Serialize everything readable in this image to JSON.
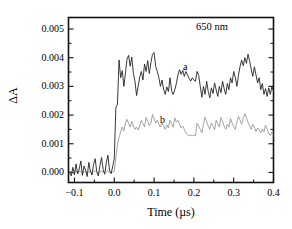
{
  "chart_data": {
    "type": "line",
    "title": "",
    "subtitle": "",
    "xlabel": "Time (µs)",
    "ylabel": "ΔA",
    "xlim": [
      -0.115,
      0.4
    ],
    "ylim": [
      -0.00035,
      0.0054
    ],
    "xticks": [
      -0.1,
      0.0,
      0.1,
      0.2,
      0.3,
      0.4
    ],
    "xtick_labels": [
      "−0.1",
      "0.0",
      "0.1",
      "0.2",
      "0.3",
      "0.4"
    ],
    "yticks": [
      0.0,
      0.001,
      0.002,
      0.003,
      0.004,
      0.005
    ],
    "ytick_labels": [
      "0.000",
      "0.001",
      "0.002",
      "0.003",
      "0.004",
      "0.005"
    ],
    "minor_ticks": true,
    "grid": false,
    "legend": "none",
    "annotations": [
      {
        "text": "650 nm",
        "x": 0.3,
        "y": 0.00485
      },
      {
        "text": "a",
        "x": 0.195,
        "y": 0.00368
      },
      {
        "text": "b",
        "x": 0.135,
        "y": 0.00188
      }
    ],
    "series": [
      {
        "name": "a",
        "color": "#222222",
        "linewidth": 0.9,
        "x": [
          -0.112,
          -0.108,
          -0.104,
          -0.1,
          -0.096,
          -0.092,
          -0.088,
          -0.084,
          -0.08,
          -0.076,
          -0.072,
          -0.068,
          -0.064,
          -0.06,
          -0.056,
          -0.052,
          -0.048,
          -0.044,
          -0.04,
          -0.036,
          -0.032,
          -0.028,
          -0.024,
          -0.02,
          -0.016,
          -0.012,
          -0.008,
          -0.004,
          0.0,
          0.004,
          0.008,
          0.012,
          0.016,
          0.02,
          0.024,
          0.028,
          0.032,
          0.036,
          0.04,
          0.044,
          0.048,
          0.052,
          0.056,
          0.06,
          0.064,
          0.068,
          0.072,
          0.076,
          0.08,
          0.084,
          0.088,
          0.092,
          0.096,
          0.1,
          0.104,
          0.108,
          0.112,
          0.116,
          0.12,
          0.124,
          0.128,
          0.132,
          0.136,
          0.14,
          0.144,
          0.148,
          0.152,
          0.156,
          0.16,
          0.164,
          0.168,
          0.172,
          0.176,
          0.18,
          0.184,
          0.188,
          0.192,
          0.196,
          0.2,
          0.204,
          0.208,
          0.212,
          0.216,
          0.22,
          0.224,
          0.228,
          0.232,
          0.236,
          0.24,
          0.244,
          0.248,
          0.252,
          0.256,
          0.26,
          0.264,
          0.268,
          0.272,
          0.276,
          0.28,
          0.284,
          0.288,
          0.292,
          0.296,
          0.3,
          0.304,
          0.308,
          0.312,
          0.316,
          0.32,
          0.324,
          0.328,
          0.332,
          0.336,
          0.34,
          0.344,
          0.348,
          0.352,
          0.356,
          0.36,
          0.364,
          0.368,
          0.372,
          0.376,
          0.38,
          0.384,
          0.388,
          0.392,
          0.396,
          0.4
        ],
        "y": [
          2e-05,
          -0.00012,
          0.00018,
          -8e-05,
          0.0003,
          -5e-05,
          0.00012,
          0.0004,
          -0.0001,
          0.00022,
          8e-05,
          -0.00014,
          0.00035,
          5e-05,
          -9e-05,
          0.00028,
          0.00048,
          3e-05,
          -0.00012,
          0.00025,
          0.00052,
          0.0001,
          -6e-05,
          0.00034,
          0.0006,
          8e-05,
          -4e-05,
          0.0002,
          0.00048,
          0.00225,
          0.00238,
          0.00392,
          0.0033,
          0.00355,
          0.003,
          0.00345,
          0.00395,
          0.00408,
          0.0037,
          0.00402,
          0.00345,
          0.00318,
          0.00268,
          0.003,
          0.00332,
          0.00352,
          0.00322,
          0.00378,
          0.00352,
          0.0039,
          0.00345,
          0.00382,
          0.00412,
          0.00418,
          0.0037,
          0.00352,
          0.0033,
          0.003,
          0.00322,
          0.0029,
          0.00272,
          0.00298,
          0.00282,
          0.0033,
          0.00285,
          0.00272,
          0.00288,
          0.0031,
          0.0034,
          0.00358,
          0.00342,
          0.00356,
          0.00335,
          0.00352,
          0.0034,
          0.00328,
          0.00318,
          0.0033,
          0.00322,
          0.00318,
          0.00352,
          0.00338,
          0.003,
          0.00262,
          0.003,
          0.00272,
          0.00318,
          0.00282,
          0.0026,
          0.00295,
          0.00275,
          0.00312,
          0.00288,
          0.00265,
          0.003,
          0.00278,
          0.00318,
          0.00292,
          0.00272,
          0.0031,
          0.00288,
          0.0033,
          0.00312,
          0.00352,
          0.00332,
          0.003,
          0.00338,
          0.0037,
          0.00392,
          0.00372,
          0.004,
          0.0038,
          0.00412,
          0.00388,
          0.0036,
          0.00335,
          0.00368,
          0.0034,
          0.00312,
          0.0033,
          0.00288,
          0.0031,
          0.00272,
          0.00292,
          0.00265,
          0.00295,
          0.00272,
          0.003,
          0.00282
        ],
        "description": "Upper black transient: flat noisy baseline near zero before t=0, sharp rise at t=0 to a noisy plateau around 0.0034 oscillating between 0.0026 and 0.0042."
      },
      {
        "name": "b",
        "color": "#9a9a9a",
        "linewidth": 0.9,
        "x": [
          -0.112,
          -0.108,
          -0.104,
          -0.1,
          -0.096,
          -0.092,
          -0.088,
          -0.084,
          -0.08,
          -0.076,
          -0.072,
          -0.068,
          -0.064,
          -0.06,
          -0.056,
          -0.052,
          -0.048,
          -0.044,
          -0.04,
          -0.036,
          -0.032,
          -0.028,
          -0.024,
          -0.02,
          -0.016,
          -0.012,
          -0.008,
          -0.004,
          0.0,
          0.004,
          0.008,
          0.012,
          0.016,
          0.02,
          0.024,
          0.028,
          0.032,
          0.036,
          0.04,
          0.044,
          0.048,
          0.052,
          0.056,
          0.06,
          0.064,
          0.068,
          0.072,
          0.076,
          0.08,
          0.084,
          0.088,
          0.092,
          0.096,
          0.1,
          0.104,
          0.108,
          0.112,
          0.116,
          0.12,
          0.124,
          0.128,
          0.132,
          0.136,
          0.14,
          0.144,
          0.148,
          0.152,
          0.156,
          0.16,
          0.164,
          0.168,
          0.172,
          0.176,
          0.18,
          0.184,
          0.188,
          0.192,
          0.196,
          0.2,
          0.204,
          0.208,
          0.212,
          0.216,
          0.22,
          0.224,
          0.228,
          0.232,
          0.236,
          0.24,
          0.244,
          0.248,
          0.252,
          0.256,
          0.26,
          0.264,
          0.268,
          0.272,
          0.276,
          0.28,
          0.284,
          0.288,
          0.292,
          0.296,
          0.3,
          0.304,
          0.308,
          0.312,
          0.316,
          0.32,
          0.324,
          0.328,
          0.332,
          0.336,
          0.34,
          0.344,
          0.348,
          0.352,
          0.356,
          0.36,
          0.364,
          0.368,
          0.372,
          0.376,
          0.38,
          0.384,
          0.388,
          0.392,
          0.396,
          0.4
        ],
        "y": [
          0.0,
          4e-05,
          -4e-05,
          2e-05,
          6e-05,
          -2e-05,
          3e-05,
          5e-05,
          -3e-05,
          2e-05,
          4e-05,
          -2e-05,
          3e-05,
          1e-05,
          -3e-05,
          4e-05,
          6e-05,
          0.0,
          -2e-05,
          3e-05,
          5e-05,
          1e-05,
          -2e-05,
          4e-05,
          6e-05,
          1e-05,
          -1e-05,
          2e-05,
          4e-05,
          0.00052,
          0.00098,
          0.00122,
          0.0014,
          0.00158,
          0.00145,
          0.00172,
          0.00185,
          0.0017,
          0.00158,
          0.00178,
          0.00162,
          0.0015,
          0.00158,
          0.00148,
          0.00162,
          0.00182,
          0.0017,
          0.00158,
          0.00192,
          0.00178,
          0.00162,
          0.00172,
          0.00202,
          0.00188,
          0.00172,
          0.00182,
          0.00168,
          0.00158,
          0.00172,
          0.00162,
          0.0015,
          0.00165,
          0.00155,
          0.00182,
          0.0017,
          0.00158,
          0.0019,
          0.00175,
          0.00182,
          0.00168,
          0.00155,
          0.00162,
          0.0015,
          0.00138,
          0.00132,
          0.00128,
          0.0013,
          0.00128,
          0.0013,
          0.00128,
          0.00172,
          0.00162,
          0.0015,
          0.00138,
          0.00168,
          0.00192,
          0.00178,
          0.00162,
          0.0015,
          0.00172,
          0.00162,
          0.00148,
          0.00182,
          0.0017,
          0.00158,
          0.00192,
          0.00178,
          0.00162,
          0.0015,
          0.00168,
          0.00158,
          0.00188,
          0.00172,
          0.0016,
          0.0015,
          0.00175,
          0.00195,
          0.00182,
          0.00168,
          0.00188,
          0.00205,
          0.0019,
          0.00175,
          0.00162,
          0.0015,
          0.00168,
          0.00158,
          0.00142,
          0.00155,
          0.00148,
          0.00138,
          0.00152,
          0.00142,
          0.00165,
          0.0015,
          0.00138,
          0.00128,
          0.0014,
          0.0013
        ],
        "description": "Lower gray transient: flat baseline near zero before t=0, rise at t=0 to a noisy plateau around 0.0016 oscillating between 0.0012 and 0.0021."
      }
    ]
  },
  "figure": {
    "annotation_text": "650 nm",
    "series_label_a": "a",
    "series_label_b": "b",
    "axis_color": "#111111"
  }
}
